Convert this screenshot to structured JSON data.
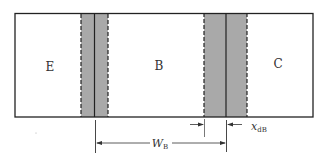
{
  "diagram": {
    "title": "",
    "regions": [
      {
        "id": "emitter",
        "label": "E"
      },
      {
        "id": "base",
        "label": "B"
      },
      {
        "id": "collector",
        "label": "C"
      }
    ],
    "dimensions": {
      "base_width": {
        "symbol": "W",
        "subscript": "B"
      },
      "depletion_in_base": {
        "symbol": "x",
        "subscript": "dB"
      }
    },
    "colors": {
      "depletion_fill": "#a9a9a9",
      "outline": "#222222",
      "background": "#ffffff"
    }
  }
}
